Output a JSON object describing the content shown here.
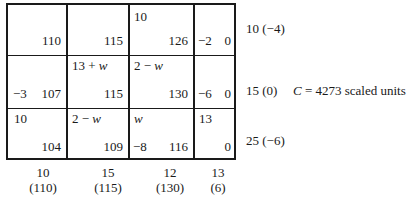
{
  "table": {
    "rows": [
      {
        "cells": [
          {
            "allocation": "",
            "delta": "",
            "cost": "110"
          },
          {
            "allocation": "",
            "delta": "",
            "cost": "115"
          },
          {
            "allocation": "10",
            "delta": "",
            "cost": "126"
          },
          {
            "allocation": "",
            "delta": "−2",
            "cost": "0"
          }
        ],
        "supply_label": "10 (−4)"
      },
      {
        "cells": [
          {
            "allocation": "",
            "delta": "−3",
            "cost": "107"
          },
          {
            "allocation": "13 + w",
            "delta": "",
            "cost": "115"
          },
          {
            "allocation": "2 − w",
            "delta": "",
            "cost": "130"
          },
          {
            "allocation": "",
            "delta": "−6",
            "cost": "0"
          }
        ],
        "supply_label": "15 (0)"
      },
      {
        "cells": [
          {
            "allocation": "10",
            "delta": "",
            "cost": "104"
          },
          {
            "allocation": "2 − w",
            "delta": "",
            "cost": "109"
          },
          {
            "allocation": "w",
            "delta": "−8",
            "cost": "116"
          },
          {
            "allocation": "13",
            "delta": "",
            "cost": "0"
          }
        ],
        "supply_label": "25 (−6)"
      }
    ],
    "columns": [
      {
        "demand": "10",
        "potential": "(110)"
      },
      {
        "demand": "15",
        "potential": "(115)"
      },
      {
        "demand": "12",
        "potential": "(130)"
      },
      {
        "demand": "13",
        "potential": "(6)"
      }
    ],
    "total_cost": {
      "symbol": "C",
      "text": " = 4273 scaled units"
    }
  }
}
